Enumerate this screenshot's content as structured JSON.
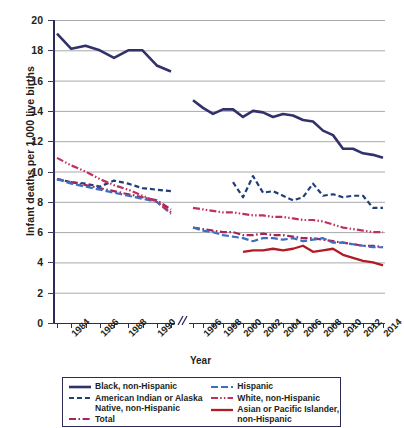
{
  "chart_data": {
    "type": "line",
    "title": "",
    "xlabel": "Year",
    "ylabel": "Infant deaths per 1,000 live births",
    "ylim": [
      0,
      20
    ],
    "yticks": [
      0,
      2,
      4,
      6,
      8,
      10,
      12,
      14,
      16,
      18,
      20
    ],
    "grid": true,
    "legend_position": "bottom",
    "axis_break": {
      "present": true,
      "between": [
        1991,
        1995
      ],
      "symbol": "//"
    },
    "x_tick_labels": [
      "1984",
      "1986",
      "1988",
      "1990",
      "1996",
      "1998",
      "2000",
      "2002",
      "2004",
      "2006",
      "2008",
      "2010",
      "2012",
      "2014"
    ],
    "x_segments": [
      {
        "name": "early",
        "years": [
          1983,
          1984,
          1985,
          1986,
          1987,
          1988,
          1989,
          1990,
          1991
        ]
      },
      {
        "name": "late",
        "years": [
          1995,
          1996,
          1997,
          1998,
          1999,
          2000,
          2001,
          2002,
          2003,
          2004,
          2005,
          2006,
          2007,
          2008,
          2009,
          2010,
          2011,
          2012,
          2013,
          2014
        ]
      }
    ],
    "series": [
      {
        "name": "Black, non-Hispanic",
        "color": "#31316b",
        "style": "solid",
        "width": 2.6,
        "early": {
          "years": [
            1983,
            1984,
            1985,
            1986,
            1987,
            1988,
            1989,
            1990,
            1991
          ],
          "values": [
            19.1,
            18.1,
            18.3,
            18.0,
            17.5,
            18.0,
            18.0,
            17.0,
            16.6
          ]
        },
        "late": {
          "years": [
            1995,
            1996,
            1997,
            1998,
            1999,
            2000,
            2001,
            2002,
            2003,
            2004,
            2005,
            2006,
            2007,
            2008,
            2009,
            2010,
            2011,
            2012,
            2013,
            2014
          ],
          "values": [
            14.7,
            14.2,
            13.8,
            14.1,
            14.1,
            13.6,
            14.0,
            13.9,
            13.6,
            13.8,
            13.7,
            13.4,
            13.3,
            12.7,
            12.4,
            11.5,
            11.5,
            11.2,
            11.1,
            10.9
          ]
        }
      },
      {
        "name": "American Indian or Alaska Native, non-Hispanic",
        "color": "#1f3f7a",
        "style": "dashed",
        "width": 2.2,
        "early": {
          "years": [
            1983,
            1984,
            1985,
            1986,
            1987,
            1988,
            1989,
            1990,
            1991
          ],
          "values": [
            9.5,
            9.3,
            9.2,
            9.0,
            9.4,
            9.2,
            8.9,
            8.8,
            8.7
          ]
        },
        "late": {
          "years": [
            1999,
            2000,
            2001,
            2002,
            2003,
            2004,
            2005,
            2006,
            2007,
            2008,
            2009,
            2010,
            2011,
            2012,
            2013,
            2014
          ],
          "values": [
            9.3,
            8.3,
            9.7,
            8.6,
            8.7,
            8.4,
            8.1,
            8.3,
            9.2,
            8.4,
            8.5,
            8.3,
            8.4,
            8.4,
            7.6,
            7.6
          ]
        }
      },
      {
        "name": "Total",
        "color": "#a7245b",
        "style": "dashdot",
        "width": 2.2,
        "early": {
          "years": [
            1983,
            1984,
            1985,
            1986,
            1987,
            1988,
            1989,
            1990,
            1991
          ],
          "values": [
            9.5,
            9.3,
            9.1,
            8.9,
            8.7,
            8.5,
            8.3,
            8.1,
            7.5
          ]
        },
        "late": {
          "years": [
            1995,
            1996,
            1997,
            1998,
            1999,
            2000,
            2001,
            2002,
            2003,
            2004,
            2005,
            2006,
            2007,
            2008,
            2009,
            2010,
            2011,
            2012,
            2013,
            2014
          ],
          "values": [
            6.3,
            6.2,
            6.1,
            6.0,
            6.0,
            5.8,
            5.8,
            5.9,
            5.8,
            5.8,
            5.7,
            5.6,
            5.6,
            5.5,
            5.4,
            5.3,
            5.2,
            5.1,
            5.1,
            5.0
          ]
        }
      },
      {
        "name": "Hispanic",
        "color": "#3b6fc4",
        "style": "longdash",
        "width": 2.2,
        "early": {
          "years": [
            1983,
            1984,
            1985,
            1986,
            1987,
            1988,
            1989,
            1990,
            1991
          ],
          "values": [
            9.5,
            9.2,
            9.0,
            8.8,
            8.6,
            8.4,
            8.2,
            8.0,
            7.2
          ]
        },
        "late": {
          "years": [
            1995,
            1996,
            1997,
            1998,
            1999,
            2000,
            2001,
            2002,
            2003,
            2004,
            2005,
            2006,
            2007,
            2008,
            2009,
            2010,
            2011,
            2012,
            2013,
            2014
          ],
          "values": [
            6.3,
            6.1,
            6.0,
            5.8,
            5.7,
            5.6,
            5.4,
            5.6,
            5.6,
            5.5,
            5.6,
            5.4,
            5.5,
            5.6,
            5.3,
            5.3,
            5.2,
            5.1,
            5.0,
            5.0
          ]
        }
      },
      {
        "name": "White, non-Hispanic",
        "color": "#c0305a",
        "style": "dashdotdot",
        "width": 2.2,
        "early": {
          "years": [
            1983,
            1984,
            1985,
            1986,
            1987,
            1988,
            1989,
            1990,
            1991
          ],
          "values": [
            10.9,
            10.4,
            10.0,
            9.5,
            9.1,
            8.8,
            8.4,
            8.0,
            7.3
          ]
        },
        "late": {
          "years": [
            1995,
            1996,
            1997,
            1998,
            1999,
            2000,
            2001,
            2002,
            2003,
            2004,
            2005,
            2006,
            2007,
            2008,
            2009,
            2010,
            2011,
            2012,
            2013,
            2014
          ],
          "values": [
            7.6,
            7.5,
            7.4,
            7.3,
            7.3,
            7.2,
            7.1,
            7.1,
            7.0,
            7.0,
            6.9,
            6.8,
            6.8,
            6.7,
            6.5,
            6.3,
            6.2,
            6.1,
            6.0,
            6.0
          ]
        }
      },
      {
        "name": "Asian or Pacific Islander, non-Hispanic",
        "color": "#b01c24",
        "style": "solid",
        "width": 2.3,
        "late": {
          "years": [
            2000,
            2001,
            2002,
            2003,
            2004,
            2005,
            2006,
            2007,
            2008,
            2009,
            2010,
            2011,
            2012,
            2013,
            2014
          ],
          "values": [
            4.7,
            4.8,
            4.8,
            4.9,
            4.8,
            4.9,
            5.1,
            4.7,
            4.8,
            4.9,
            4.5,
            4.3,
            4.1,
            4.0,
            3.8
          ]
        }
      }
    ]
  },
  "axis": {
    "y_title": "Infant deaths per 1,000 live births",
    "x_title": "Year"
  },
  "legend": {
    "column1": [
      {
        "label": "Black, non-Hispanic",
        "series": "Black, non-Hispanic"
      },
      {
        "label": "American Indian or Alaska\nNative, non-Hispanic",
        "series": "American Indian or Alaska Native, non-Hispanic"
      },
      {
        "label": "Total",
        "series": "Total"
      }
    ],
    "column2": [
      {
        "label": "Hispanic",
        "series": "Hispanic"
      },
      {
        "label": "White, non-Hispanic",
        "series": "White, non-Hispanic"
      },
      {
        "label": "Asian or Pacific Islander,\nnon-Hispanic",
        "series": "Asian or Pacific Islander, non-Hispanic"
      }
    ]
  }
}
